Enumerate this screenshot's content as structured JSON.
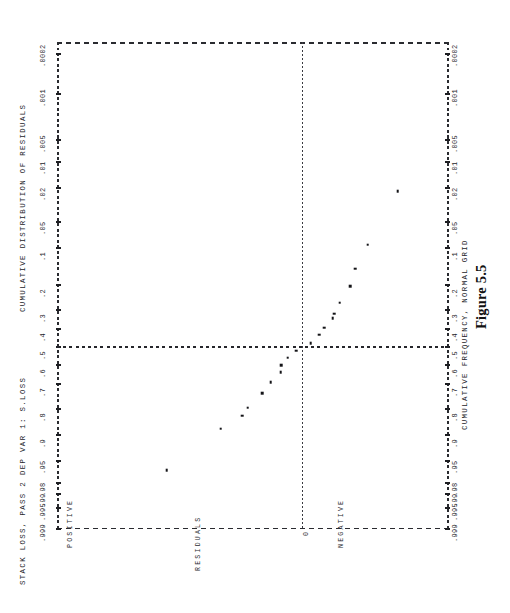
{
  "figure": {
    "caption": "Figure 5.5",
    "header_title": "STACK LOSS, PASS 2 DEP VAR 1: S.LOSS",
    "left_axis_title": "CUMULATIVE DISTRIBUTION OF RESIDUALS",
    "right_axis_title": "CUMULATIVE FREQUENCY, NORMAL GRID",
    "residual_axis_title": "RESIDUALS",
    "zero_label": "0",
    "positive_label": "POSITIVE",
    "negative_label": "NEGATIVE"
  },
  "colors": {
    "ink": "#1a1a1a",
    "grid": "#2a2b30",
    "point": "#141418",
    "paper": "#ffffff"
  },
  "chart_data": {
    "type": "scatter",
    "title": "STACK LOSS, PASS 2 DEP VAR 1: S.LOSS",
    "subtitle": "CUMULATIVE DISTRIBUTION OF RESIDUALS",
    "xlabel": "RESIDUALS",
    "ylabel": "CUMULATIVE FREQUENCY, NORMAL GRID",
    "grid": true,
    "legend": "none",
    "orientation": "rotated-90",
    "probability_ticks": [
      ".0002",
      ".001",
      ".005",
      ".01",
      ".02",
      ".05",
      ".1",
      ".2",
      ".3",
      ".4",
      ".5",
      ".6",
      ".7",
      ".8",
      ".9",
      ".95",
      ".98",
      ".99",
      ".995",
      ".999"
    ],
    "probability_tick_values": [
      0.0002,
      0.001,
      0.005,
      0.01,
      0.02,
      0.05,
      0.1,
      0.2,
      0.3,
      0.4,
      0.5,
      0.6,
      0.7,
      0.8,
      0.9,
      0.95,
      0.98,
      0.99,
      0.995,
      0.999
    ],
    "reference_lines": {
      "horizontal_probability": 0.5,
      "vertical_residual": 0.0
    },
    "residual_axis_categories": [
      "POSITIVE",
      "0",
      "NEGATIVE"
    ],
    "n_points": 21,
    "points": [
      {
        "p": 0.965,
        "residual": 0.95
      },
      {
        "p": 0.88,
        "residual": 0.57
      },
      {
        "p": 0.83,
        "residual": 0.42
      },
      {
        "p": 0.795,
        "residual": 0.38
      },
      {
        "p": 0.74,
        "residual": 0.28
      },
      {
        "p": 0.69,
        "residual": 0.22
      },
      {
        "p": 0.64,
        "residual": 0.15
      },
      {
        "p": 0.6,
        "residual": 0.145
      },
      {
        "p": 0.56,
        "residual": 0.1
      },
      {
        "p": 0.52,
        "residual": 0.04
      },
      {
        "p": 0.478,
        "residual": -0.06
      },
      {
        "p": 0.432,
        "residual": -0.12
      },
      {
        "p": 0.392,
        "residual": -0.155
      },
      {
        "p": 0.343,
        "residual": -0.215
      },
      {
        "p": 0.318,
        "residual": -0.225
      },
      {
        "p": 0.268,
        "residual": -0.265
      },
      {
        "p": 0.205,
        "residual": -0.34
      },
      {
        "p": 0.15,
        "residual": -0.375
      },
      {
        "p": 0.092,
        "residual": -0.46
      },
      {
        "p": 0.022,
        "residual": -0.67
      },
      {
        "p": 0.5,
        "residual": 0.0
      }
    ],
    "ylim": [
      0.0002,
      0.999
    ],
    "xlim": [
      -1.0,
      1.0
    ]
  },
  "axis_layout": {
    "tick_positions_px": [
      12,
      52,
      98,
      120,
      146,
      180,
      206,
      243,
      268,
      287,
      305,
      323,
      342,
      367,
      393,
      419,
      441,
      452,
      466,
      487
    ]
  }
}
